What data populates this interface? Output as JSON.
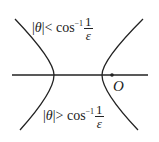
{
  "diagram": {
    "upper_label": {
      "abs_open": "|",
      "var": "θ",
      "abs_close": "|",
      "rel": "<",
      "func": "cos",
      "sup": "−1",
      "num": "1",
      "den": "ε"
    },
    "lower_label": {
      "abs_open": "|",
      "var": "θ",
      "abs_close": "|",
      "rel": ">",
      "func": "cos",
      "sup": "−1",
      "num": "1",
      "den": "ε"
    },
    "origin_label": "O",
    "colors": {
      "stroke": "#222222",
      "background": "#ffffff"
    }
  }
}
